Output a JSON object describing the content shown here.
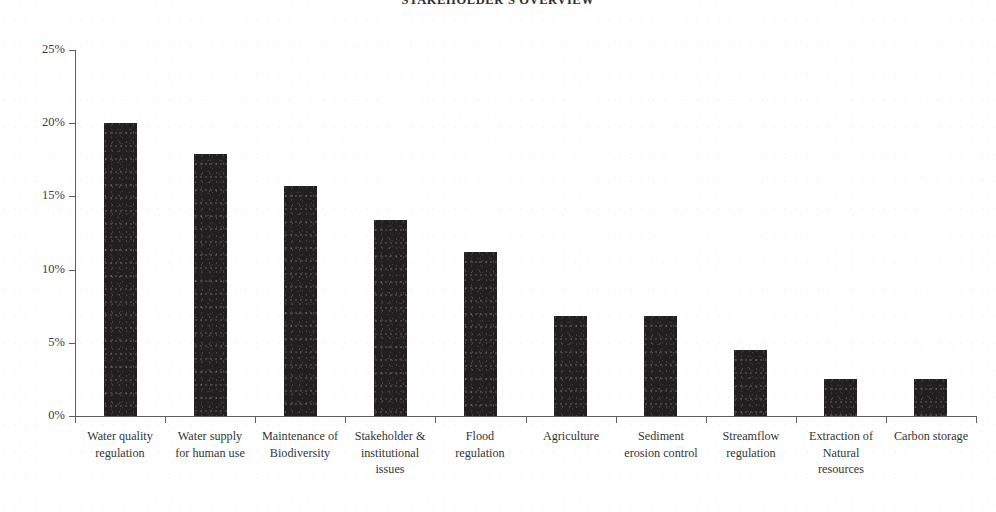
{
  "chart_data": {
    "type": "bar",
    "title": "STAKEHOLDER'S  OVERVIEW",
    "xlabel": "",
    "ylabel": "",
    "ylim": [
      0,
      25
    ],
    "y_tick_labels": [
      "25%",
      "20%",
      "15%",
      "10%",
      "5%",
      "0%"
    ],
    "y_tick_values": [
      25,
      20,
      15,
      10,
      5,
      0
    ],
    "grid": false,
    "legend": null,
    "bar_color": "#211f1f",
    "axis_color": "#5d5d5d",
    "categories": [
      "Water quality regulation",
      "Water supply for human use",
      "Maintenance of Biodiversity",
      "Stakeholder & institutional issues",
      "Flood regulation",
      "Agriculture",
      "Sediment erosion control",
      "Streamflow regulation",
      "Extraction of Natural resources",
      "Carbon storage"
    ],
    "category_lines": [
      [
        "Water quality",
        "regulation"
      ],
      [
        "Water supply",
        "for human use"
      ],
      [
        "Maintenance of",
        "Biodiversity"
      ],
      [
        "Stakeholder &",
        "institutional",
        "issues"
      ],
      [
        "Flood",
        "regulation"
      ],
      [
        "Agriculture"
      ],
      [
        "Sediment",
        "erosion control"
      ],
      [
        "Streamflow",
        "regulation"
      ],
      [
        "Extraction of",
        "Natural",
        "resources"
      ],
      [
        "Carbon storage"
      ]
    ],
    "values": [
      20.0,
      17.9,
      15.7,
      13.4,
      11.2,
      6.8,
      6.8,
      4.5,
      2.5,
      2.5
    ],
    "value_labels": [
      "20%",
      "17.9%",
      "15.7%",
      "13.4%",
      "11.2%",
      "6.8%",
      "6.8%",
      "4.5%",
      "2.5%",
      "2.5%"
    ]
  }
}
